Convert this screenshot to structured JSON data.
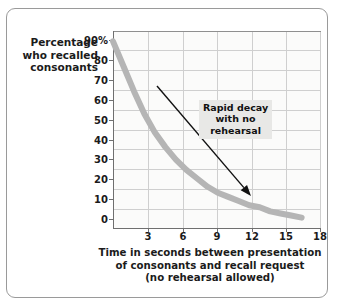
{
  "chart_data": {
    "type": "line",
    "title": "",
    "xlabel_lines": [
      "Time in seconds between presentation",
      "of consonants and recall request",
      "(no rehearsal allowed)"
    ],
    "ylabel_lines": [
      "Percentage",
      "who recalled",
      "consonants"
    ],
    "x": [
      0,
      1,
      2,
      3,
      4,
      5,
      6,
      7,
      8,
      9,
      10,
      11,
      12,
      13,
      14,
      15,
      16,
      17,
      18
    ],
    "values": [
      90,
      78,
      66,
      55,
      46,
      39,
      33,
      28,
      24,
      20,
      17,
      15,
      13,
      11,
      10,
      8,
      7,
      6,
      5
    ],
    "series": [
      {
        "name": "Recall without rehearsal",
        "values": [
          90,
          78,
          66,
          55,
          46,
          39,
          33,
          28,
          24,
          20,
          17,
          15,
          13,
          11,
          10,
          8,
          7,
          6,
          5
        ]
      }
    ],
    "xticks": [
      3,
      6,
      9,
      12,
      15,
      18
    ],
    "xtick_labels": [
      "3",
      "6",
      "9",
      "12",
      "15",
      "18"
    ],
    "yticks": [
      0,
      10,
      20,
      30,
      40,
      50,
      60,
      70,
      80,
      90
    ],
    "ytick_labels": [
      "0",
      "10",
      "20",
      "30",
      "40",
      "50",
      "60",
      "70",
      "80",
      "90%"
    ],
    "xlim": [
      0,
      19.8
    ],
    "ylim": [
      0,
      95
    ],
    "grid": true,
    "legend": "none",
    "line_color": "#b5b5b5",
    "line_width_px": 6,
    "plot_background": "#fbfbfa",
    "grid_color": "#cfcfcf",
    "axis_color": "#6f6f6f",
    "annotations": [
      {
        "name": "rapid-decay-annotation",
        "lines": [
          "Rapid decay",
          "with no",
          "rehearsal"
        ],
        "background": "#e8e8e6",
        "arrow": {
          "from_x": 157,
          "from_y": 86,
          "to_x": 251,
          "to_y": 196,
          "color": "#111111"
        }
      }
    ]
  },
  "frame": {
    "border_color": "#9a9a9a"
  }
}
